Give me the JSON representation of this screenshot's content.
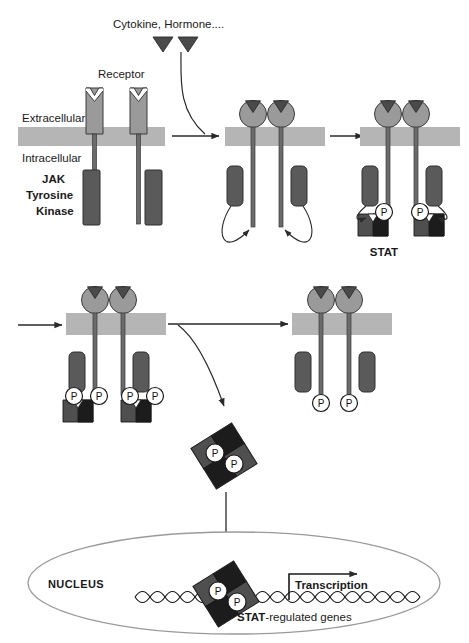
{
  "figure": {
    "labels": {
      "ligand": "Cytokine, Hormone....",
      "receptor": "Receptor",
      "extracellular": "Extracellular",
      "intracellular": "Intracellular",
      "jak_line1": "JAK",
      "jak_line2": "Tyrosine",
      "jak_line3": "Kinase",
      "stat": "STAT",
      "nucleus": "NUCLEUS",
      "transcription": "Transcription",
      "stat_genes_bold": "STAT",
      "stat_genes_rest": "-regulated genes",
      "phosphate": "P"
    },
    "colors": {
      "membrane": "#b5b5b5",
      "receptor_body": "#9a9a9a",
      "receptor_tail": "#6b6b6b",
      "jak_block": "#5a5a5a",
      "ligand_triangle": "#4a4a4a",
      "stat_dark": "#4f4f4f",
      "stat_black": "#1c1c1c",
      "outline": "#2a2a2a",
      "nucleus_border": "#9a9a9a",
      "background": "#ffffff"
    },
    "phosphate_counts": {
      "panel_activated_stat": 2,
      "panel_row2_left": 4,
      "panel_row2_right": 2,
      "stat_dimer_cytoplasm": 2,
      "stat_dimer_nucleus": 2
    },
    "stages": [
      "Inactive receptor monomers with JAK tyrosine kinases",
      "Ligand-induced receptor dimerization and JAK activation",
      "Receptor phosphorylation and STAT recruitment",
      "STAT phosphorylation and dimerization",
      "Receptor complex after STAT release",
      "STAT dimer translocation to nucleus",
      "STAT dimer binds DNA and drives transcription"
    ]
  }
}
